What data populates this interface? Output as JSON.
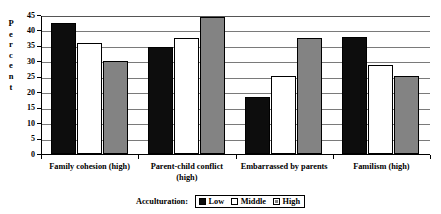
{
  "chart_data": {
    "type": "bar",
    "title": "",
    "xlabel": "",
    "ylabel": "Percent",
    "ylim": [
      0,
      45
    ],
    "yticks": [
      0,
      5,
      10,
      15,
      20,
      25,
      30,
      35,
      40,
      45
    ],
    "grid": true,
    "legend_position": "bottom",
    "legend_title": "Acculturation:",
    "categories": [
      "Family cohesion (high)",
      "Parent-child conflict (high)",
      "Embarrassed by parents",
      "Familism (high)"
    ],
    "series": [
      {
        "name": "Low",
        "color": "#0d0d0d",
        "values": [
          42.3,
          34.8,
          18.5,
          38.0
        ]
      },
      {
        "name": "Middle",
        "color": "#ffffff",
        "values": [
          36.0,
          37.5,
          25.3,
          28.8
        ]
      },
      {
        "name": "High",
        "color": "#838383",
        "values": [
          30.0,
          44.3,
          37.4,
          25.1
        ]
      }
    ]
  },
  "axis": {
    "y_title_letters": [
      "P",
      "e",
      "r",
      "c",
      "e",
      "n",
      "t"
    ],
    "tick_labels": [
      "45",
      "40",
      "35",
      "30",
      "25",
      "20",
      "15",
      "10",
      "5",
      "0"
    ]
  },
  "legend": {
    "title": "Acculturation:",
    "items": [
      {
        "label": "Low"
      },
      {
        "label": "Middle"
      },
      {
        "label": "High"
      }
    ]
  }
}
